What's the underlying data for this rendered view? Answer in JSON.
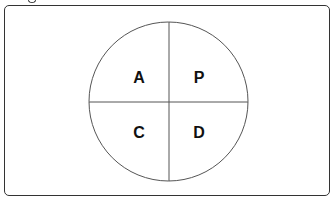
{
  "diagram": {
    "type": "quadrant-circle",
    "quadrants": {
      "top_left": "A",
      "top_right": "P",
      "bottom_left": "C",
      "bottom_right": "D"
    },
    "colors": {
      "stroke": "#333333",
      "text": "#111111",
      "background": "#ffffff"
    }
  }
}
